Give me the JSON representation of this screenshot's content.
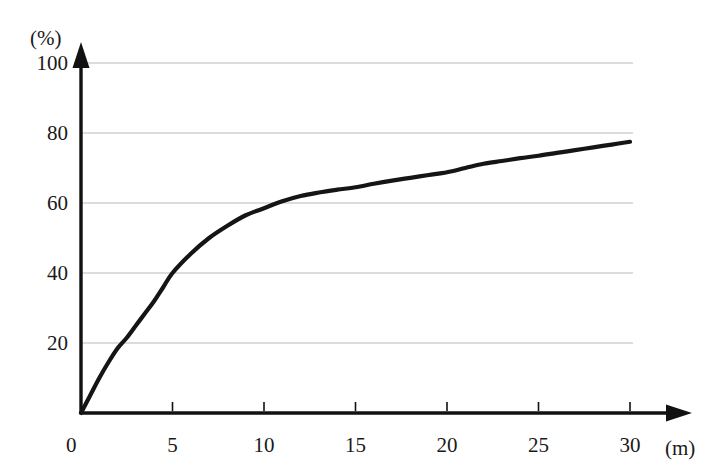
{
  "chart_data": {
    "type": "line",
    "title": "",
    "subtitle": "",
    "xlabel": "(m)",
    "ylabel": "(%)",
    "xlim": [
      0,
      31.5
    ],
    "ylim": [
      0,
      100
    ],
    "grid": true,
    "legend": null,
    "x_ticks": [
      0,
      5,
      10,
      15,
      20,
      25,
      30
    ],
    "x_tick_labels": [
      "0",
      "5",
      "10",
      "15",
      "20",
      "25",
      "30"
    ],
    "y_ticks": [
      0,
      20,
      40,
      60,
      80,
      100
    ],
    "y_tick_labels": [
      "0",
      "20",
      "40",
      "60",
      "80",
      "100"
    ],
    "series": [
      {
        "name": "cumulative-percentage",
        "color": "#151515",
        "x": [
          0,
          0.5,
          1,
          1.5,
          2,
          2.5,
          3,
          3.5,
          4,
          4.5,
          5,
          6,
          7,
          8,
          9,
          10,
          11,
          12,
          13,
          14,
          15,
          16,
          17,
          18,
          19,
          20,
          21,
          22,
          23,
          24,
          25,
          26,
          27,
          28,
          29,
          30
        ],
        "y": [
          0,
          5,
          10,
          14.5,
          18.5,
          21.5,
          25,
          28.5,
          32,
          36,
          40,
          45.5,
          50,
          53.5,
          56.5,
          58.5,
          60.5,
          62,
          63,
          63.8,
          64.5,
          65.5,
          66.4,
          67.2,
          68,
          68.8,
          70,
          71.2,
          72,
          72.8,
          73.5,
          74.3,
          75.1,
          75.9,
          76.7,
          77.5
        ]
      }
    ],
    "annotations": []
  },
  "axes": {
    "y_unit_label": "(%)",
    "x_unit_label": "(m)"
  },
  "colors": {
    "curve": "#151515",
    "axis": "#111111",
    "gridline": "#b9b9b9",
    "text": "#1a1a1a",
    "background": "#ffffff"
  }
}
